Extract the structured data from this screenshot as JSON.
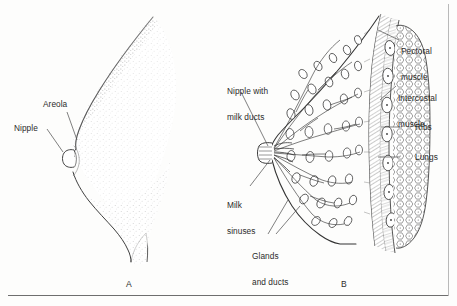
{
  "figure": {
    "panels": [
      {
        "id": "A",
        "caption": "A",
        "description": "External lateral profile of breast with stippled shading"
      },
      {
        "id": "B",
        "caption": "B",
        "description": "Sagittal cross section of breast and chest wall"
      }
    ]
  },
  "panel_a": {
    "labels": [
      {
        "name": "areola",
        "text": "Areola"
      },
      {
        "name": "nipple",
        "text": "Nipple"
      }
    ]
  },
  "panel_b": {
    "labels_left": [
      {
        "name": "nipple-with-milk-ducts",
        "line1": "Nipple with",
        "line2": "milk ducts"
      },
      {
        "name": "milk-sinuses",
        "line1": "Milk",
        "line2": "sinuses"
      },
      {
        "name": "glands-and-ducts",
        "line1": "Glands",
        "line2": "and ducts"
      }
    ],
    "labels_right": [
      {
        "name": "pectoral-muscle",
        "line1": "Pectoral",
        "line2": "muscle"
      },
      {
        "name": "intercostal-muscle",
        "line1": "Intercostal",
        "line2": "muscle"
      },
      {
        "name": "ribs",
        "line1": "Ribs",
        "line2": ""
      },
      {
        "name": "lungs",
        "line1": "Lungs",
        "line2": ""
      }
    ]
  },
  "colors": {
    "ink": "#2b2b2b",
    "line": "#3a3a3a",
    "leader": "#555555",
    "rule": "#6e6e6e",
    "stipple": "#767676",
    "background": "#fdfdfc"
  }
}
